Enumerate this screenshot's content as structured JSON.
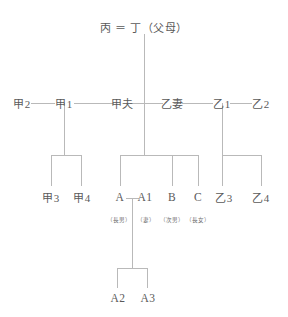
{
  "diagram": {
    "line_color": "#b9b9b9",
    "text_color": "#5a5a5a",
    "background": "#ffffff",
    "generations": {
      "gen1": {
        "text": "丙 ＝ 丁（父母）",
        "members": [
          {
            "id": "bing",
            "label": "丙"
          },
          {
            "id": "marriage-mark",
            "label": "＝"
          },
          {
            "id": "ding",
            "label": "丁"
          },
          {
            "id": "parents-note",
            "label": "（父母）"
          }
        ]
      },
      "gen2": [
        {
          "id": "jia2",
          "label": "甲2"
        },
        {
          "id": "jia1",
          "label": "甲1"
        },
        {
          "id": "jiafu",
          "label": "甲夫"
        },
        {
          "id": "yiqi",
          "label": "乙妻"
        },
        {
          "id": "yi1",
          "label": "乙1"
        },
        {
          "id": "yi2",
          "label": "乙2"
        }
      ],
      "gen3": [
        {
          "id": "jia3",
          "label": "甲3",
          "kin": ""
        },
        {
          "id": "jia4",
          "label": "甲4",
          "kin": ""
        },
        {
          "id": "a",
          "label": "A",
          "kin": "（長男）"
        },
        {
          "id": "a1",
          "label": "A1",
          "kin": "（妻）"
        },
        {
          "id": "b",
          "label": "B",
          "kin": "（次男）"
        },
        {
          "id": "c",
          "label": "C",
          "kin": "（長女）"
        },
        {
          "id": "yi3",
          "label": "乙3",
          "kin": ""
        },
        {
          "id": "yi4",
          "label": "乙4",
          "kin": ""
        }
      ],
      "gen4": [
        {
          "id": "a2",
          "label": "A2"
        },
        {
          "id": "a3",
          "label": "A3"
        }
      ]
    }
  }
}
